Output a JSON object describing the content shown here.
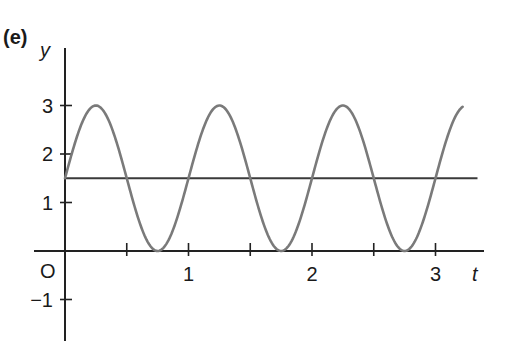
{
  "panel_label": "(e)",
  "chart_data": {
    "type": "line",
    "title": "(e)",
    "xlabel": "t",
    "ylabel": "y",
    "origin_label": "O",
    "xlim": [
      0,
      3.2
    ],
    "ylim": [
      -1.6,
      3.8
    ],
    "x_ticks": [
      0.5,
      1,
      1.5,
      2,
      2.5,
      3
    ],
    "x_tick_labels": [
      {
        "value": 1,
        "label": "1"
      },
      {
        "value": 2,
        "label": "2"
      },
      {
        "value": 3,
        "label": "3"
      }
    ],
    "y_ticks": [
      -1,
      1,
      2,
      3
    ],
    "y_tick_labels": [
      {
        "value": 3,
        "label": "3"
      },
      {
        "value": 2,
        "label": "2"
      },
      {
        "value": 1,
        "label": "1"
      },
      {
        "value": -1,
        "label": "−1"
      }
    ],
    "grid": false,
    "legend": null,
    "series": [
      {
        "name": "y = 1.5 + 1.5 sin(2πt)",
        "function": "1.5 + 1.5*sin(2*pi*t)",
        "t_range": [
          0,
          3.22
        ],
        "points": [
          {
            "t": 0,
            "y": 1.5
          },
          {
            "t": 0.25,
            "y": 3
          },
          {
            "t": 0.5,
            "y": 1.5
          },
          {
            "t": 0.75,
            "y": 0
          },
          {
            "t": 1,
            "y": 1.5
          },
          {
            "t": 1.25,
            "y": 3
          },
          {
            "t": 1.5,
            "y": 1.5
          },
          {
            "t": 1.75,
            "y": 0
          },
          {
            "t": 2,
            "y": 1.5
          },
          {
            "t": 2.25,
            "y": 3
          },
          {
            "t": 2.5,
            "y": 1.5
          },
          {
            "t": 2.75,
            "y": 0
          },
          {
            "t": 3,
            "y": 1.5
          },
          {
            "t": 3.22,
            "y": 2.97
          }
        ],
        "color": "#7a7a7a"
      },
      {
        "name": "y = 1.5",
        "function": "1.5",
        "t_range": [
          0,
          3.34
        ],
        "color": "#3a3a3a"
      }
    ]
  },
  "colors": {
    "axis": "#222222",
    "curve": "#7a7a7a",
    "midline": "#3a3a3a",
    "text": "#1a1a1a"
  }
}
